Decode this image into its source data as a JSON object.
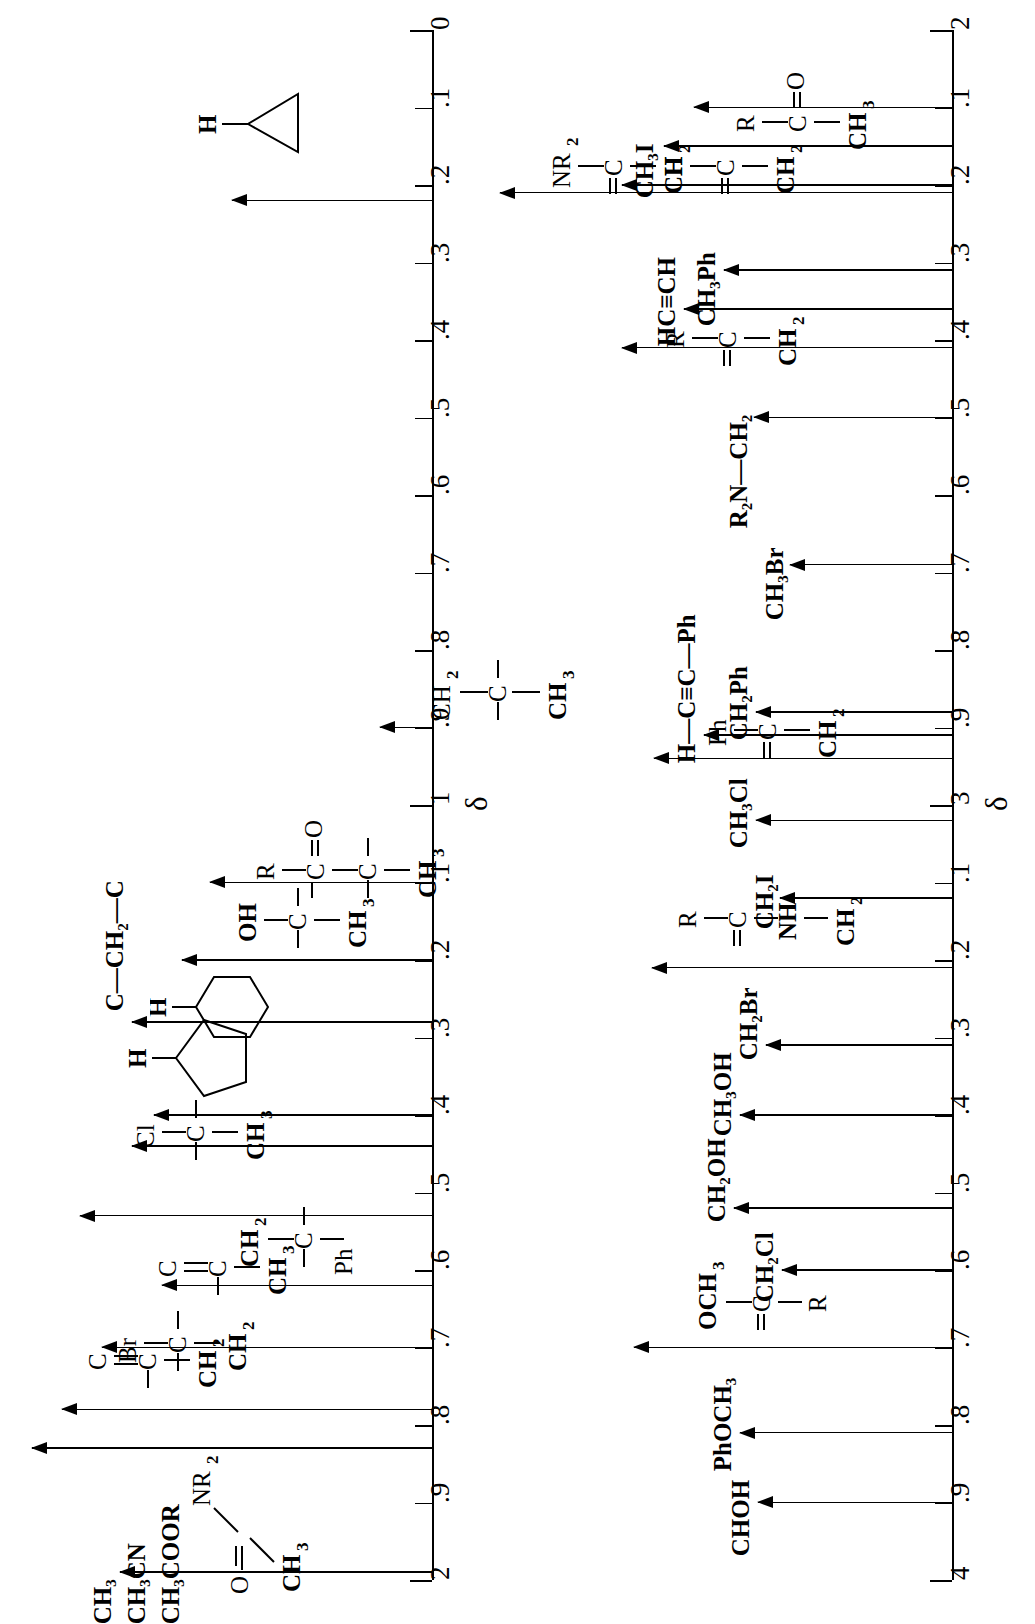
{
  "figure": {
    "type": "nmr-chemical-shift-correlation-chart",
    "orientation": "rotated-90-counterclockwise",
    "axis_symbol": "δ"
  },
  "chart_data": {
    "type": "scatter",
    "title": "",
    "xlabel": "",
    "ylabel": "δ",
    "grid": false,
    "legend": "none",
    "axes": [
      {
        "name": "axis-left",
        "range": [
          0,
          2
        ],
        "major_ticks": [
          0,
          1,
          2
        ],
        "tick_labels": [
          "0",
          ".1",
          ".2",
          ".3",
          ".4",
          ".5",
          ".6",
          ".7",
          ".8",
          ".9",
          "1",
          ".1",
          ".2",
          ".3",
          ".4",
          ".5",
          ".6",
          ".7",
          ".8",
          ".9",
          "2"
        ],
        "tick_values": [
          0,
          0.1,
          0.2,
          0.3,
          0.4,
          0.5,
          0.6,
          0.7,
          0.8,
          0.9,
          1.0,
          1.1,
          1.2,
          1.3,
          1.4,
          1.5,
          1.6,
          1.7,
          1.8,
          1.9,
          2.0
        ],
        "delta_label_at": 1.0
      },
      {
        "name": "axis-right",
        "range": [
          2,
          4
        ],
        "major_ticks": [
          2,
          3,
          4
        ],
        "tick_labels": [
          "2",
          ".1",
          ".2",
          ".3",
          ".4",
          ".5",
          ".6",
          ".7",
          ".8",
          ".9",
          "3",
          ".1",
          ".2",
          ".3",
          ".4",
          ".5",
          ".6",
          ".7",
          ".8",
          ".9",
          "4"
        ],
        "tick_values": [
          2.0,
          2.1,
          2.2,
          2.3,
          2.4,
          2.5,
          2.6,
          2.7,
          2.8,
          2.9,
          3.0,
          3.1,
          3.2,
          3.3,
          3.4,
          3.5,
          3.6,
          3.7,
          3.8,
          3.9,
          4.0
        ],
        "delta_label_at": 3.0
      }
    ],
    "entries": [
      {
        "axis": "axis-left",
        "shift": 0.22,
        "label": "cyclopropane-H",
        "text": "H",
        "kind": "structure",
        "structure": "cyclopropane-with-H"
      },
      {
        "axis": "axis-left",
        "shift": 0.9,
        "label": "CH3-C-CH2",
        "text": "CH₃",
        "kind": "structure",
        "structure": "quaternary-CH3-C-CH2"
      },
      {
        "axis": "axis-left",
        "shift": 1.1,
        "label": "CH3-C-CO-R",
        "text": "CH₃",
        "kind": "structure",
        "structure": "CH3-C-C(=O)R"
      },
      {
        "axis": "axis-left",
        "shift": 1.2,
        "label": "CH3-C-OH",
        "text": "CH₃",
        "kind": "structure",
        "structure": "CH3-C-OH"
      },
      {
        "axis": "axis-left",
        "shift": 1.28,
        "label": "C-CH2-C",
        "text": "C—CH₂—C",
        "kind": "text"
      },
      {
        "axis": "axis-left",
        "shift": 1.4,
        "label": "cyclohexane-H",
        "text": "H",
        "kind": "structure",
        "structure": "cyclohexane-with-H"
      },
      {
        "axis": "axis-left",
        "shift": 1.44,
        "label": "cyclopentane-H",
        "text": "H",
        "kind": "structure",
        "structure": "cyclopentane-with-H"
      },
      {
        "axis": "axis-left",
        "shift": 1.53,
        "label": "CH3-C-Cl",
        "text": "CH₃",
        "kind": "structure",
        "structure": "CH3-C-Cl"
      },
      {
        "axis": "axis-left",
        "shift": 1.62,
        "label": "Ph-C-CH2",
        "text": "CH₂",
        "kind": "structure",
        "structure": "Ph-C-CH2"
      },
      {
        "axis": "axis-left",
        "shift": 1.7,
        "label": "CH3-C=C",
        "text": "CH₃",
        "kind": "structure",
        "structure": "CH3-C=C"
      },
      {
        "axis": "axis-left",
        "shift": 1.78,
        "label": "CH2-C-Br",
        "text": "CH₂",
        "kind": "structure",
        "structure": "CH2-C-Br"
      },
      {
        "axis": "axis-left",
        "shift": 1.83,
        "label": "CH2-C=C",
        "text": "CH₂",
        "kind": "structure",
        "structure": "CH2-C=C"
      },
      {
        "axis": "axis-left",
        "shift": 1.99,
        "label": "CH3CO-NR2 / CH3CN / CH3COOR",
        "text": "CH₃COOR",
        "kind": "group",
        "group_texts": [
          "CH₃",
          "CH₃CN",
          "CH₃COOR"
        ],
        "group_note": "CH₃—C(=O)—NR₂"
      },
      {
        "axis": "axis-right",
        "shift": 2.1,
        "label": "CH3-CO-R",
        "text": "CH₃",
        "kind": "structure",
        "structure": "CH3-C(=O)R"
      },
      {
        "axis": "axis-right",
        "shift": 2.15,
        "label": "CH3I",
        "text": "CH₃I",
        "kind": "text"
      },
      {
        "axis": "axis-right",
        "shift": 2.2,
        "label": "CH2-CHO",
        "text": "CH₂",
        "kind": "structure",
        "structure": "CH2-C(=O)H"
      },
      {
        "axis": "axis-right",
        "shift": 2.21,
        "label": "CH2-CO-NR2",
        "text": "CH₂",
        "kind": "structure",
        "structure": "CH2-C(=O)NR2"
      },
      {
        "axis": "axis-right",
        "shift": 2.31,
        "label": "CH3Ph",
        "text": "CH₃Ph",
        "kind": "text"
      },
      {
        "axis": "axis-right",
        "shift": 2.36,
        "label": "HC≡CH",
        "text": "HC≡CH",
        "kind": "text"
      },
      {
        "axis": "axis-right",
        "shift": 2.41,
        "label": "CH2-CO-R",
        "text": "CH₂",
        "kind": "structure",
        "structure": "CH2-C(=O)R"
      },
      {
        "axis": "axis-right",
        "shift": 2.5,
        "label": "R2N-CH2",
        "text": "R₂N—CH₂",
        "kind": "text"
      },
      {
        "axis": "axis-right",
        "shift": 2.69,
        "label": "CH3Br",
        "text": "CH₃Br",
        "kind": "text"
      },
      {
        "axis": "axis-right",
        "shift": 2.88,
        "label": "CH2Ph",
        "text": "CH₂Ph",
        "kind": "text"
      },
      {
        "axis": "axis-right",
        "shift": 2.91,
        "label": "H-C≡C-Ph",
        "text": "H—C≡C—Ph",
        "kind": "text"
      },
      {
        "axis": "axis-right",
        "shift": 2.94,
        "label": "CH2-CO-Ph",
        "text": "CH₂",
        "kind": "structure",
        "structure": "CH2-C(=O)Ph"
      },
      {
        "axis": "axis-right",
        "shift": 3.02,
        "label": "CH3Cl",
        "text": "CH₃Cl",
        "kind": "text"
      },
      {
        "axis": "axis-right",
        "shift": 3.12,
        "label": "CH2I",
        "text": "CH₂I",
        "kind": "text"
      },
      {
        "axis": "axis-right",
        "shift": 3.21,
        "label": "CH2-NH-CO-R",
        "text": "CH₂",
        "kind": "structure",
        "structure": "CH2-NH-C(=O)R"
      },
      {
        "axis": "axis-right",
        "shift": 3.31,
        "label": "CH2Br",
        "text": "CH₂Br",
        "kind": "text"
      },
      {
        "axis": "axis-right",
        "shift": 3.4,
        "label": "CH3OH",
        "text": "CH₃OH",
        "kind": "text"
      },
      {
        "axis": "axis-right",
        "shift": 3.52,
        "label": "CH2OH",
        "text": "CH₂OH",
        "kind": "text"
      },
      {
        "axis": "axis-right",
        "shift": 3.6,
        "label": "CH2Cl",
        "text": "CH₂Cl",
        "kind": "text"
      },
      {
        "axis": "axis-right",
        "shift": 3.7,
        "label": "R-CO-OCH3",
        "text": "R",
        "kind": "structure",
        "structure": "R-C(=O)OCH3"
      },
      {
        "axis": "axis-right",
        "shift": 3.81,
        "label": "PhOCH3",
        "text": "PhOCH₃",
        "kind": "text"
      },
      {
        "axis": "axis-right",
        "shift": 3.9,
        "label": "CHOH",
        "text": "CHOH",
        "kind": "text"
      }
    ]
  },
  "axis_left": {
    "labels": [
      "0",
      ".1",
      ".2",
      ".3",
      ".4",
      ".5",
      ".6",
      ".7",
      ".8",
      ".9",
      "1",
      ".1",
      ".2",
      ".3",
      ".4",
      ".5",
      ".6",
      ".7",
      ".8",
      ".9",
      "2"
    ],
    "delta": "δ"
  },
  "axis_right": {
    "labels": [
      "2",
      ".1",
      ".2",
      ".3",
      ".4",
      ".5",
      ".6",
      ".7",
      ".8",
      ".9",
      "3",
      ".1",
      ".2",
      ".3",
      ".4",
      ".5",
      ".6",
      ".7",
      ".8",
      ".9",
      "4"
    ],
    "delta": "δ"
  },
  "text_labels": {
    "H": "H",
    "C_CH2_C": "C—CH₂—C",
    "CH3": "CH₃",
    "CH2": "CH₂",
    "CH3I": "CH₃I",
    "CH3Ph": "CH₃Ph",
    "HCCH": "HC≡CH",
    "R2N_CH2": "R₂N—CH₂",
    "CH3Br": "CH₃Br",
    "CH2Ph": "CH₂Ph",
    "H_CC_Ph": "H—C≡C—Ph",
    "CH3Cl": "CH₃Cl",
    "CH2I": "CH₂I",
    "CH2Br": "CH₂Br",
    "CH3OH": "CH₃OH",
    "CH2OH": "CH₂OH",
    "CH2Cl": "CH₂Cl",
    "PhOCH3": "PhOCH₃",
    "CHOH": "CHOH",
    "CH3CN": "CH₃CN",
    "CH3COOR": "CH₃COOR",
    "NR2": "NR₂",
    "O": "O",
    "R": "R",
    "Cl": "Cl",
    "Br": "Br",
    "Ph": "Ph",
    "C": "C",
    "NH": "NH",
    "OH": "OH",
    "OCH3": "OCH₃"
  }
}
